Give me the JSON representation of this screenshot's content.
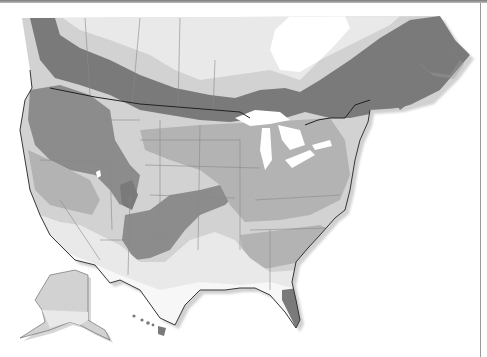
{
  "map": {
    "title": "North America zone map",
    "type": "choropleth",
    "region": "North America (Canada, contiguous United States, Alaska, Hawaii)",
    "zone_colors": {
      "zone_1_lightest": "#e9e9e9",
      "zone_2_light": "#d2d2d2",
      "zone_3_medium": "#b3b3b3",
      "zone_4_dark": "#8c8c8c",
      "zone_5_darkest": "#7a7a7a"
    },
    "background": "#ffffff",
    "water_color": "#ffffff",
    "border_color": "#222222",
    "state_line_color": "#8a8a8a",
    "shadow_color": "#c8c8c8",
    "insets": [
      "Alaska",
      "Hawaii"
    ],
    "labels": []
  }
}
